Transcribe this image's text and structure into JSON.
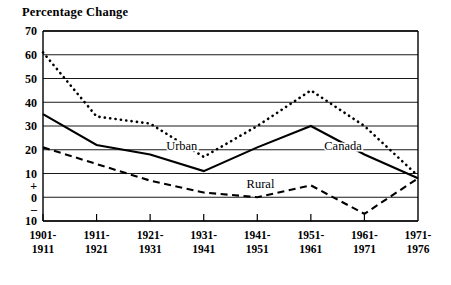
{
  "chart_data": {
    "type": "line",
    "title": "Percentage Change",
    "xlabel": "",
    "ylabel": "Percentage Change",
    "ylim": [
      -10,
      70
    ],
    "grid": true,
    "legend_position": "inline-annotations",
    "categories": [
      "1901-\n1911",
      "1911-\n1921",
      "1921-\n1931",
      "1931-\n1941",
      "1941-\n1951",
      "1951-\n1961",
      "1961-\n1971",
      "1971-\n1976"
    ],
    "category_lines": [
      [
        "1901-",
        "1911"
      ],
      [
        "1911-",
        "1921"
      ],
      [
        "1921-",
        "1931"
      ],
      [
        "1931-",
        "1941"
      ],
      [
        "1941-",
        "1951"
      ],
      [
        "1951-",
        "1961"
      ],
      [
        "1961-",
        "1971"
      ],
      [
        "1971-",
        "1976"
      ]
    ],
    "ytick_labels": [
      "70",
      "60",
      "50",
      "40",
      "30",
      "20",
      "10",
      "+",
      "0",
      "–",
      "10"
    ],
    "ytick_values": [
      70,
      60,
      50,
      40,
      30,
      20,
      10,
      5,
      0,
      -5,
      -10
    ],
    "gridline_values": [
      70,
      60,
      50,
      40,
      30,
      20,
      10,
      0,
      -10
    ],
    "series": [
      {
        "name": "Urban",
        "style": "dotted",
        "color": "#000000",
        "values": [
          61,
          34,
          31,
          17,
          30,
          45,
          30,
          9
        ]
      },
      {
        "name": "Canada",
        "style": "solid",
        "color": "#000000",
        "values": [
          35,
          22,
          18,
          11,
          21,
          30,
          18,
          8
        ]
      },
      {
        "name": "Rural",
        "style": "dashed",
        "color": "#000000",
        "values": [
          21,
          14,
          7,
          2,
          0,
          5,
          -7,
          8
        ]
      }
    ],
    "annotations": [
      {
        "text": "Urban",
        "series": "Urban",
        "x_frac": 0.37,
        "y_value": 22
      },
      {
        "text": "Canada",
        "series": "Canada",
        "x_frac": 0.8,
        "y_value": 22
      },
      {
        "text": "Rural",
        "series": "Rural",
        "x_frac": 0.58,
        "y_value": 6
      }
    ]
  }
}
